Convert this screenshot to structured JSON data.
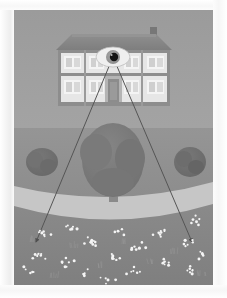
{
  "scene": {
    "title": "House with watching eye overlooking lawn",
    "canvas": {
      "width": 199,
      "height": 275
    },
    "colors": {
      "sky": "#9d9d9d",
      "sky_bottom": "#a3a3a3",
      "lawn_upper": "#8f8f8f",
      "lawn_lower": "#848484",
      "path": "#c9c9c9",
      "house_wall": "#e8e8e8",
      "house_trim": "#8b8b8b",
      "roof": "#8a8a8a",
      "roof_shadow": "#7d7d7d",
      "chimney": "#7a7a7a",
      "window_glass": "#d7d7d7",
      "window_frame": "#f2f2f2",
      "door": "#8f8f8f",
      "tree_canopy": "#7b7b7b",
      "tree_canopy_dark": "#6f6f6f",
      "tree_trunk": "#8a8a8a",
      "bush": "#6f6f6f",
      "sightline": "#5a5a5a",
      "eye_sclera": "#f0f0f0",
      "eye_iris": "#9a9a9a",
      "eye_pupil": "#1a1a1a",
      "flower": "#f4f4f4",
      "paper": "#ffffff"
    },
    "house": {
      "label": "two-storey house facade",
      "x": 44,
      "y": 24,
      "width": 112,
      "height": 72,
      "roof": {
        "label": "pitched roof",
        "peak_inset": 14,
        "height": 15
      },
      "chimney": {
        "label": "chimney",
        "x": 136,
        "y": 18,
        "width": 7,
        "height": 9
      },
      "storeys": 2,
      "windows_upper": [
        {
          "x": 52,
          "y": 46,
          "width": 17,
          "height": 13
        },
        {
          "x": 73,
          "y": 46,
          "width": 15,
          "height": 13
        },
        {
          "x": 112,
          "y": 46,
          "width": 15,
          "height": 13
        },
        {
          "x": 132,
          "y": 46,
          "width": 17,
          "height": 13
        }
      ],
      "windows_lower": [
        {
          "x": 52,
          "y": 70,
          "width": 17,
          "height": 13
        },
        {
          "x": 73,
          "y": 70,
          "width": 15,
          "height": 13
        },
        {
          "x": 112,
          "y": 70,
          "width": 15,
          "height": 13
        },
        {
          "x": 132,
          "y": 70,
          "width": 17,
          "height": 13
        }
      ],
      "door": {
        "label": "front door",
        "x": 91,
        "y": 66,
        "width": 16,
        "height": 24
      }
    },
    "eye": {
      "label": "watching eye",
      "cx": 99,
      "cy": 47,
      "rx": 17,
      "ry": 10,
      "iris_r": 7,
      "pupil_r": 4.2
    },
    "sightlines": [
      {
        "label": "sight-line-left",
        "x1": 97,
        "y1": 55,
        "x2": 22,
        "y2": 232
      },
      {
        "label": "sight-line-right",
        "x1": 101,
        "y1": 55,
        "x2": 178,
        "y2": 232
      }
    ],
    "path": {
      "label": "curved path band",
      "top_y": 168,
      "bottom_y": 206,
      "curve_depth": 24
    },
    "trees": [
      {
        "label": "tree-center",
        "cx": 99,
        "cy": 150,
        "rx": 31,
        "ry": 37,
        "trunk_w": 9,
        "trunk_h": 22
      },
      {
        "label": "bush-left",
        "cx": 28,
        "cy": 152,
        "rx": 16,
        "ry": 14
      },
      {
        "label": "bush-right",
        "cx": 176,
        "cy": 152,
        "rx": 16,
        "ry": 15
      }
    ],
    "flower_clusters": [
      {
        "cx": 30,
        "cy": 222,
        "n": 7
      },
      {
        "cx": 55,
        "cy": 217,
        "n": 6
      },
      {
        "cx": 24,
        "cy": 246,
        "n": 8
      },
      {
        "cx": 52,
        "cy": 252,
        "n": 7
      },
      {
        "cx": 78,
        "cy": 232,
        "n": 9
      },
      {
        "cx": 70,
        "cy": 264,
        "n": 6
      },
      {
        "cx": 99,
        "cy": 248,
        "n": 7
      },
      {
        "cx": 104,
        "cy": 221,
        "n": 5
      },
      {
        "cx": 126,
        "cy": 238,
        "n": 7
      },
      {
        "cx": 120,
        "cy": 262,
        "n": 6
      },
      {
        "cx": 146,
        "cy": 222,
        "n": 8
      },
      {
        "cx": 150,
        "cy": 252,
        "n": 7
      },
      {
        "cx": 172,
        "cy": 234,
        "n": 6
      },
      {
        "cx": 180,
        "cy": 210,
        "n": 6
      },
      {
        "cx": 176,
        "cy": 262,
        "n": 7
      },
      {
        "cx": 190,
        "cy": 244,
        "n": 5
      },
      {
        "cx": 14,
        "cy": 262,
        "n": 5
      },
      {
        "cx": 94,
        "cy": 270,
        "n": 5
      }
    ],
    "grass_tufts": [
      {
        "cx": 60,
        "cy": 238
      },
      {
        "cx": 88,
        "cy": 258
      },
      {
        "cx": 110,
        "cy": 234
      },
      {
        "cx": 136,
        "cy": 254
      },
      {
        "cx": 40,
        "cy": 268
      },
      {
        "cx": 160,
        "cy": 244
      },
      {
        "cx": 20,
        "cy": 232
      },
      {
        "cx": 188,
        "cy": 266
      }
    ]
  }
}
